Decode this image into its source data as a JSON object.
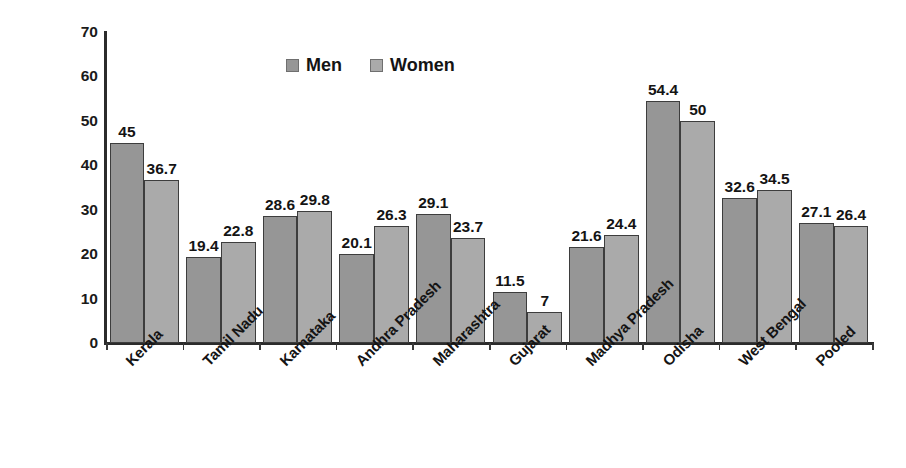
{
  "chart_data": {
    "type": "bar",
    "title": "",
    "xlabel": "",
    "ylabel": "Prevalence (%) of hypertension",
    "ylim": [
      0,
      70
    ],
    "yticks": [
      70,
      60,
      50,
      40,
      30,
      20,
      10,
      0
    ],
    "grid": false,
    "legend_position": "top-center",
    "categories": [
      "Kerala",
      "Tamil Nadu",
      "Karnataka",
      "Andhra Pradesh",
      "Maharashtra",
      "Gujarat",
      "Madhya Pradesh",
      "Odisha",
      "West Bengal",
      "Pooled"
    ],
    "series": [
      {
        "name": "Men",
        "color": "#969696",
        "values": [
          45,
          19.4,
          28.6,
          20.1,
          29.1,
          11.5,
          21.6,
          54.4,
          32.6,
          27.1
        ],
        "labels": [
          "45",
          "19.4",
          "28.6",
          "20.1",
          "29.1",
          "11.5",
          "21.6",
          "54.4",
          "32.6",
          "27.1"
        ]
      },
      {
        "name": "Women",
        "color": "#aaaaaa",
        "values": [
          36.7,
          22.8,
          29.8,
          26.3,
          23.7,
          7,
          24.4,
          50,
          34.5,
          26.4
        ],
        "labels": [
          "36.7",
          "22.8",
          "29.8",
          "26.3",
          "23.7",
          "7",
          "24.4",
          "50",
          "34.5",
          "26.4"
        ]
      }
    ]
  },
  "legend": {
    "items": [
      {
        "label": "Men",
        "color": "#969696"
      },
      {
        "label": "Women",
        "color": "#aaaaaa"
      }
    ]
  },
  "axis": {
    "y_title": "Prevalence (%) of hypertension"
  }
}
